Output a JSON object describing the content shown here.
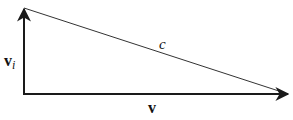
{
  "diagram": {
    "type": "vector-triangle",
    "colors": {
      "stroke": "#1a1a1a",
      "background": "#ffffff"
    },
    "vectors": [
      {
        "id": "v_i",
        "label": "v",
        "subscript": "i",
        "direction": "up",
        "from": [
          24,
          94
        ],
        "to": [
          24,
          8
        ]
      },
      {
        "id": "v",
        "label": "v",
        "direction": "right",
        "from": [
          24,
          94
        ],
        "to": [
          289,
          94
        ]
      }
    ],
    "hypotenuse": {
      "label": "c",
      "from": [
        24,
        8
      ],
      "to": [
        285,
        93
      ]
    }
  }
}
